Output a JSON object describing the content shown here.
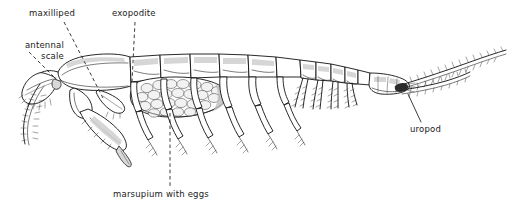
{
  "figure": {
    "background_color": "#ffffff",
    "ink_color": "#111111",
    "width": 521,
    "height": 217
  },
  "labels": {
    "maxilliped": "maxilliped",
    "exopodite": "exopodite",
    "antennal_scale_line1": "antennal",
    "antennal_scale_line2": "scale",
    "marsupium": "marsupium with eggs",
    "uropod": "uropod"
  },
  "parts": [
    {
      "name": "antennal scale",
      "label": "antennal\nscale",
      "leader": "dashed",
      "region": "head-anterior"
    },
    {
      "name": "maxilliped",
      "label": "maxilliped",
      "leader": "dashed",
      "region": "head-ventral"
    },
    {
      "name": "exopodite",
      "label": "exopodite",
      "leader": "dashed",
      "region": "thorax-appendage"
    },
    {
      "name": "marsupium with eggs",
      "label": "marsupium with eggs",
      "leader": "dashed",
      "region": "thorax-ventral-brood-pouch"
    },
    {
      "name": "uropod",
      "label": "uropod",
      "leader": "solid",
      "region": "tail-fan"
    }
  ]
}
